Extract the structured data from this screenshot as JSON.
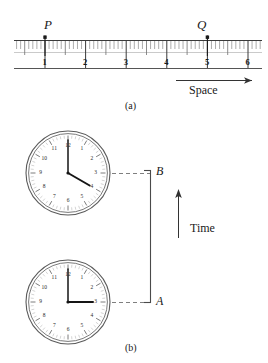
{
  "figure": {
    "panel_a": {
      "caption": "(a)",
      "axis_label": "Space",
      "tick_numbers": [
        "1",
        "2",
        "3",
        "4",
        "5",
        "6"
      ],
      "tick_values": [
        1,
        2,
        3,
        4,
        5,
        6
      ],
      "minor_tick_step": 0.1,
      "medium_tick_step": 0.5,
      "events": [
        {
          "name": "P",
          "label": "P",
          "position": 1.0
        },
        {
          "name": "Q",
          "label": "Q",
          "position": 5.0
        }
      ]
    },
    "panel_b": {
      "caption": "(b)",
      "axis_label": "Time",
      "clocks": [
        {
          "name": "upper-clock",
          "event_label": "B",
          "hour_hand": 4,
          "minute_hand": 12,
          "time_text": "4:00",
          "numerals": [
            "12",
            "1",
            "2",
            "3",
            "4",
            "5",
            "6",
            "7",
            "8",
            "9",
            "10",
            "11"
          ]
        },
        {
          "name": "lower-clock",
          "event_label": "A",
          "hour_hand": 3,
          "minute_hand": 12,
          "time_text": "3:00",
          "numerals": [
            "12",
            "1",
            "2",
            "3",
            "4",
            "5",
            "6",
            "7",
            "8",
            "9",
            "10",
            "11"
          ]
        }
      ]
    },
    "colors": {
      "ink": "#1a1a1a",
      "rule": "#3a3a3a",
      "minor_tick": "#8a8a8a",
      "dashed": "#707070",
      "background": "#ffffff"
    }
  }
}
